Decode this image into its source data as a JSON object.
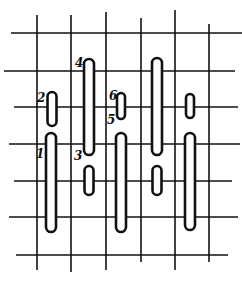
{
  "diagram": {
    "type": "stitch-grid",
    "colors": {
      "ink": "#111111",
      "background": "#ffffff"
    },
    "grid": {
      "vertical_lines": [
        {
          "x": 37,
          "y1": 15,
          "y2": 270
        },
        {
          "x": 71,
          "y1": 15,
          "y2": 272
        },
        {
          "x": 106,
          "y1": 12,
          "y2": 270
        },
        {
          "x": 141,
          "y1": 18,
          "y2": 262
        },
        {
          "x": 175,
          "y1": 10,
          "y2": 270
        },
        {
          "x": 209,
          "y1": 24,
          "y2": 262
        }
      ],
      "horizontal_lines": [
        {
          "y": 33,
          "x1": 11,
          "x2": 242
        },
        {
          "y": 71,
          "x1": 4,
          "x2": 235
        },
        {
          "y": 107,
          "x1": 14,
          "x2": 238
        },
        {
          "y": 144,
          "x1": 9,
          "x2": 240
        },
        {
          "y": 181,
          "x1": 14,
          "x2": 232
        },
        {
          "y": 217,
          "x1": 9,
          "x2": 238
        },
        {
          "y": 255,
          "x1": 16,
          "x2": 228
        }
      ]
    },
    "stitches": [
      {
        "x": 52,
        "y1": 92,
        "y2": 126,
        "w": 9
      },
      {
        "x": 51,
        "y1": 133,
        "y2": 232,
        "w": 10
      },
      {
        "x": 89,
        "y1": 59,
        "y2": 155,
        "w": 10
      },
      {
        "x": 89,
        "y1": 166,
        "y2": 195,
        "w": 9
      },
      {
        "x": 121,
        "y1": 93,
        "y2": 119,
        "w": 8
      },
      {
        "x": 121,
        "y1": 133,
        "y2": 232,
        "w": 10
      },
      {
        "x": 157,
        "y1": 58,
        "y2": 155,
        "w": 10
      },
      {
        "x": 157,
        "y1": 166,
        "y2": 195,
        "w": 9
      },
      {
        "x": 190,
        "y1": 94,
        "y2": 118,
        "w": 8
      },
      {
        "x": 190,
        "y1": 133,
        "y2": 230,
        "w": 10
      }
    ],
    "labels": [
      {
        "text": "1",
        "x": 36,
        "y": 158
      },
      {
        "text": "2",
        "x": 37,
        "y": 102
      },
      {
        "text": "3",
        "x": 74,
        "y": 160
      },
      {
        "text": "4",
        "x": 75,
        "y": 67
      },
      {
        "text": "5",
        "x": 107,
        "y": 124
      },
      {
        "text": "6",
        "x": 109,
        "y": 100
      }
    ]
  }
}
